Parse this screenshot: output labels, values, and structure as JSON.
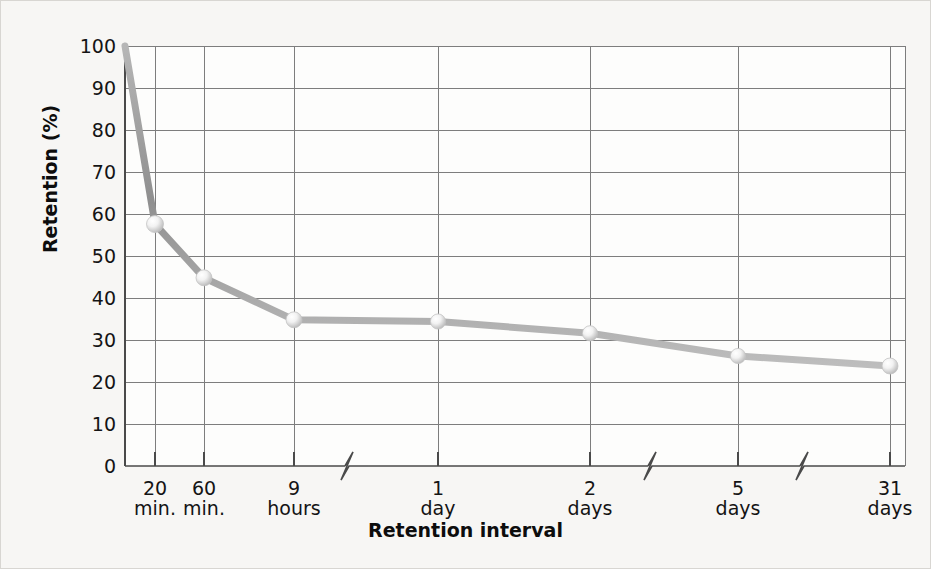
{
  "chart_data": {
    "type": "line",
    "title": "",
    "subtitle": "",
    "xlabel": "Retention interval",
    "ylabel": "Retention (%)",
    "x_tick_labels": [
      {
        "num": "20",
        "unit": "min."
      },
      {
        "num": "60",
        "unit": "min."
      },
      {
        "num": "9",
        "unit": "hours"
      },
      {
        "num": "1",
        "unit": "day"
      },
      {
        "num": "2",
        "unit": "days"
      },
      {
        "num": "5",
        "unit": "days"
      },
      {
        "num": "31",
        "unit": "days"
      }
    ],
    "categories": [
      "20 min.",
      "60 min.",
      "9 hours",
      "1 day",
      "2 days",
      "5 days",
      "31 days"
    ],
    "values": [
      57.6,
      44.8,
      34.8,
      34.4,
      31.6,
      26.2,
      23.8
    ],
    "origin_value": 100,
    "y_tick_labels": [
      "100",
      "90",
      "80",
      "70",
      "60",
      "50",
      "40",
      "30",
      "20",
      "10",
      "0"
    ],
    "ylim": [
      0,
      100
    ],
    "y_tick_step": 10,
    "grid": true,
    "legend": "none",
    "axis_breaks": [
      {
        "between": "9 hours",
        "and": "1 day"
      },
      {
        "between": "2 days",
        "and": "5 days"
      },
      {
        "between": "5 days",
        "and": "31 days"
      }
    ],
    "marker_style": "sphere",
    "series_color": "#9b9b9b",
    "grid_color": "#7d7d7d",
    "plot_background": "#fdfdfc",
    "page_background": "#f7f6f4",
    "text_color": "#141414"
  }
}
